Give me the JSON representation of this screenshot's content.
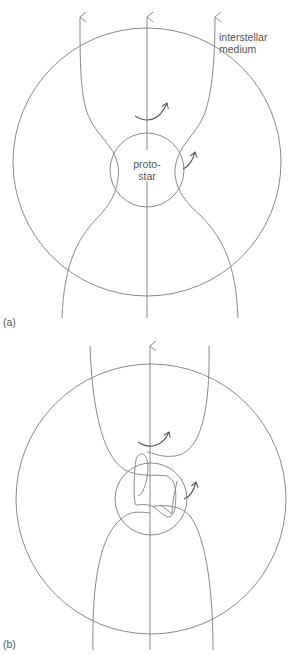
{
  "panels": [
    {
      "id": "a",
      "label": "(a)",
      "outer_region_label": [
        "interstellar",
        "medium"
      ],
      "inner_label": [
        "proto-",
        "star"
      ],
      "description": "Magnetic field lines pinched toward protostar; rotation arrows around axis"
    },
    {
      "id": "b",
      "label": "(b)",
      "description": "Field lines twisted/wound inside protostar region due to rotation"
    }
  ],
  "colors": {
    "line": "#8a8a8a",
    "text": "#555555",
    "background": "#ffffff"
  }
}
